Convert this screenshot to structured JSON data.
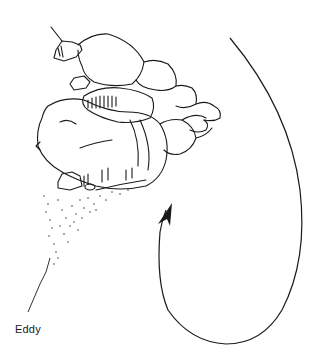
{
  "figure": {
    "type": "line-drawing",
    "labels": {
      "eddy": "Eddy"
    },
    "colors": {
      "ink": "#1a1a1a",
      "background": "#ffffff"
    },
    "elements": [
      {
        "name": "boulder-cluster",
        "description": "stacked rounded boulders drawn in ink"
      },
      {
        "name": "stipple-wake",
        "description": "dotted sediment trail extending down-left"
      },
      {
        "name": "eddy-arrow",
        "description": "large curved arrow looping clockwise from top-right down and back up, arrowhead pointing up"
      }
    ]
  }
}
